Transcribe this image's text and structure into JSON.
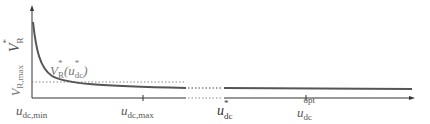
{
  "diagram": {
    "y_axis_label": "V*_R",
    "y_tick_label": "V_R,max",
    "curve_label": "V*_R(u*_dc)",
    "x_tick_labels": [
      "u_dc,min",
      "u_dc,max",
      "u*_dc",
      "u_dc^opt"
    ],
    "colors": {
      "axis": "#333333",
      "curve": "#555555",
      "dotted": "#888888",
      "text": "#555555"
    }
  },
  "labels": {
    "y_axis_main": "V",
    "y_axis_sup": "*",
    "y_axis_sub": "R",
    "y_tick_main": "V",
    "y_tick_sub": "R,max",
    "curve_main": "V",
    "curve_sup": "*",
    "curve_sub": "R",
    "curve_arg_open": "(u",
    "curve_arg_sup": "*",
    "curve_arg_sub": "dc",
    "curve_arg_close": ")",
    "x_min_main": "u",
    "x_min_sub": "dc,min",
    "x_max_main": "u",
    "x_max_sub": "dc,max",
    "x_star_main": "u",
    "x_star_sup": "*",
    "x_star_sub": "dc",
    "x_opt_main": "u",
    "x_opt_sup": "opt",
    "x_opt_sub": "dc"
  }
}
